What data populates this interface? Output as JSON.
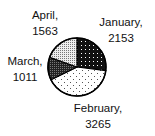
{
  "chart_data": {
    "type": "pie",
    "title": "",
    "categories": [
      "January",
      "February",
      "March",
      "April"
    ],
    "values": [
      2153,
      3265,
      1011,
      1563
    ],
    "start_angle": "12 o'clock",
    "direction": "clockwise",
    "legend": "none",
    "data_labels": "category, value",
    "slices": [
      {
        "label": "January",
        "value": 2153,
        "pattern": "black-with-white-dots",
        "label_line1": "January,",
        "label_line2": "2153"
      },
      {
        "label": "February",
        "value": 3265,
        "pattern": "white-with-sparse-dots",
        "label_line1": "February,",
        "label_line2": "3265"
      },
      {
        "label": "March",
        "value": 1011,
        "pattern": "black-dense-checker",
        "label_line1": "March,",
        "label_line2": "1011"
      },
      {
        "label": "April",
        "value": 1563,
        "pattern": "light-gray-dots",
        "label_line1": "April,",
        "label_line2": "1563"
      }
    ]
  },
  "colors": {
    "outline": "#000000",
    "background": "#ffffff"
  }
}
